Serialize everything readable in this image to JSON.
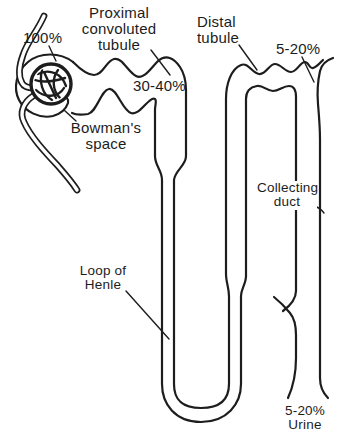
{
  "diagram": {
    "title_hidden": "",
    "colors": {
      "line": "#1d1d1d",
      "background": "#ffffff"
    },
    "labels": {
      "filtrate_pct": "100%",
      "proximal_tubule": "Proximal\nconvoluted\ntubule",
      "bowmans_space": "Bowman's\nspace",
      "proximal_reabsorption_pct": "30-40%",
      "distal_tubule": "Distal\ntubule",
      "distal_reabsorption_pct": "5-20%",
      "collecting_duct": "Collecting\nduct",
      "loop_of_henle": "Loop of\nHenle",
      "urine_pct": "5-20%\nUrine"
    }
  }
}
